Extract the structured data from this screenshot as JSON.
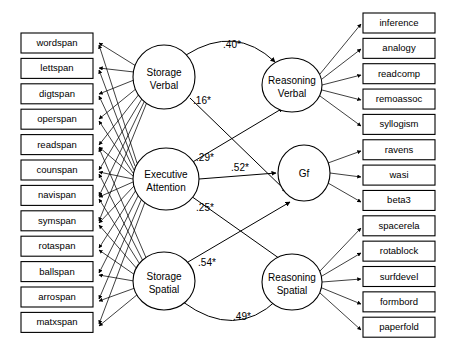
{
  "diagram": {
    "type": "path-diagram",
    "background_color": "#ffffff",
    "line_color": "#000000",
    "box_fill": "#ffffff"
  },
  "left_indicators": [
    {
      "id": "wordspan",
      "label": "wordspan"
    },
    {
      "id": "lettspan",
      "label": "lettspan"
    },
    {
      "id": "digtspan",
      "label": "digtspan"
    },
    {
      "id": "operspan",
      "label": "operspan"
    },
    {
      "id": "readspan",
      "label": "readspan"
    },
    {
      "id": "counspan",
      "label": "counspan"
    },
    {
      "id": "navispan",
      "label": "navispan"
    },
    {
      "id": "symspan",
      "label": "symspan"
    },
    {
      "id": "rotaspan",
      "label": "rotaspan"
    },
    {
      "id": "ballspan",
      "label": "ballspan"
    },
    {
      "id": "arrospan",
      "label": "arrospan"
    },
    {
      "id": "matxspan",
      "label": "matxspan"
    }
  ],
  "right_indicators": [
    {
      "id": "inference",
      "label": "inference"
    },
    {
      "id": "analogy",
      "label": "analogy"
    },
    {
      "id": "readcomp",
      "label": "readcomp"
    },
    {
      "id": "remoassoc",
      "label": "remoassoc"
    },
    {
      "id": "syllogism",
      "label": "syllogism"
    },
    {
      "id": "ravens",
      "label": "ravens"
    },
    {
      "id": "wasi",
      "label": "wasi"
    },
    {
      "id": "beta3",
      "label": "beta3"
    },
    {
      "id": "spacerela",
      "label": "spacerela"
    },
    {
      "id": "rotablock",
      "label": "rotablock"
    },
    {
      "id": "surfdevel",
      "label": "surfdevel"
    },
    {
      "id": "formbord",
      "label": "formbord"
    },
    {
      "id": "paperfold",
      "label": "paperfold"
    }
  ],
  "latents": [
    {
      "id": "storage-verbal",
      "line1": "Storage",
      "line2": "Verbal"
    },
    {
      "id": "executive-attention",
      "line1": "Executive",
      "line2": "Attention"
    },
    {
      "id": "storage-spatial",
      "line1": "Storage",
      "line2": "Spatial"
    },
    {
      "id": "reasoning-verbal",
      "line1": "Reasoning",
      "line2": "Verbal"
    },
    {
      "id": "gf",
      "line1": "Gf",
      "line2": ""
    },
    {
      "id": "reasoning-spatial",
      "line1": "Reasoning",
      "line2": "Spatial"
    }
  ],
  "paths": [
    {
      "id": "storage-verbal-to-reasoning-verbal",
      "from": "storage-verbal",
      "to": "reasoning-verbal",
      "coefficient": ".40*"
    },
    {
      "id": "storage-verbal-to-gf",
      "from": "storage-verbal",
      "to": "gf",
      "coefficient": ".16*"
    },
    {
      "id": "executive-attention-to-reasoning-verbal",
      "from": "executive-attention",
      "to": "reasoning-verbal",
      "coefficient": ".29*"
    },
    {
      "id": "executive-attention-to-gf",
      "from": "executive-attention",
      "to": "gf",
      "coefficient": ".52*"
    },
    {
      "id": "executive-attention-to-reasoning-spatial",
      "from": "executive-attention",
      "to": "reasoning-spatial",
      "coefficient": ".25*"
    },
    {
      "id": "storage-spatial-to-gf",
      "from": "storage-spatial",
      "to": "gf",
      "coefficient": ".54*"
    },
    {
      "id": "storage-spatial-to-reasoning-spatial",
      "from": "storage-spatial",
      "to": "reasoning-spatial",
      "coefficient": ".49*"
    }
  ]
}
